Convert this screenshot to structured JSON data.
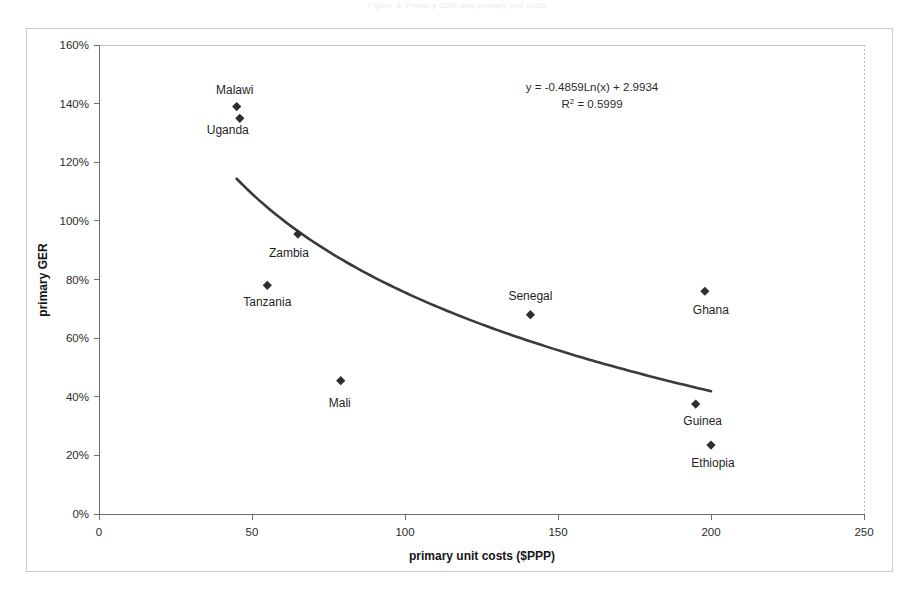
{
  "page": {
    "faint_header": "Figure 4: Primary GER and primary unit costs"
  },
  "chart_data": {
    "type": "scatter",
    "title": "",
    "xlabel": "primary unit costs ($PPP)",
    "ylabel": "primary GER",
    "xlim": [
      0,
      250
    ],
    "ylim": [
      0,
      1.6
    ],
    "xticks": [
      "0",
      "50",
      "100",
      "150",
      "200",
      "250"
    ],
    "xtick_values": [
      0,
      50,
      100,
      150,
      200,
      250
    ],
    "yticks": [
      "0%",
      "20%",
      "40%",
      "60%",
      "80%",
      "100%",
      "120%",
      "140%",
      "160%"
    ],
    "ytick_values": [
      0,
      0.2,
      0.4,
      0.6,
      0.8,
      1.0,
      1.2,
      1.4,
      1.6
    ],
    "grid": false,
    "legend": "none",
    "points": [
      {
        "name": "Malawi",
        "x": 45,
        "y": 1.39,
        "label_dx": -2,
        "label_dy": -13
      },
      {
        "name": "Uganda",
        "x": 46,
        "y": 1.35,
        "label_dx": -12,
        "label_dy": 16
      },
      {
        "name": "Zambia",
        "x": 65,
        "y": 0.955,
        "label_dx": -9,
        "label_dy": 23
      },
      {
        "name": "Tanzania",
        "x": 55,
        "y": 0.78,
        "label_dx": 0,
        "label_dy": 21
      },
      {
        "name": "Mali",
        "x": 79,
        "y": 0.455,
        "label_dx": -1,
        "label_dy": 26
      },
      {
        "name": "Senegal",
        "x": 141,
        "y": 0.68,
        "label_dx": 0,
        "label_dy": -15
      },
      {
        "name": "Ghana",
        "x": 198,
        "y": 0.76,
        "label_dx": 6,
        "label_dy": 23
      },
      {
        "name": "Guinea",
        "x": 195,
        "y": 0.375,
        "label_dx": 7,
        "label_dy": 21
      },
      {
        "name": "Ethiopia",
        "x": 200,
        "y": 0.235,
        "label_dx": 2,
        "label_dy": 22
      }
    ],
    "trendline": {
      "type": "logarithmic",
      "equation": "y = -0.4859Ln(x) + 2.9934",
      "r_squared_label": "R",
      "r_squared_exponent": "2",
      "r_squared_value": "= 0.5999",
      "slope": -0.4859,
      "intercept": 2.9934,
      "x_start": 45,
      "x_end": 200
    },
    "colors": {
      "marker": "#2e2e2e",
      "trendline": "#3a3a3a",
      "axis": "#6e6e72",
      "frame": "#bdbdc4",
      "text": "#1f1f1f",
      "background": "#ffffff"
    }
  }
}
